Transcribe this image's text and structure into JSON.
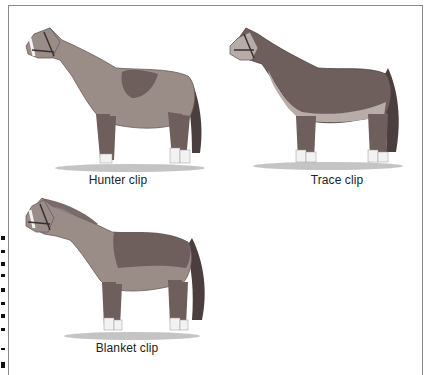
{
  "figure": {
    "panels": [
      {
        "id": "hunter",
        "caption": "Hunter clip",
        "description": "Horse with clipped body, saddle patch and legs left unclipped"
      },
      {
        "id": "trace",
        "caption": "Trace clip",
        "description": "Horse with lower neck, belly and upper legs clipped"
      },
      {
        "id": "blanket",
        "caption": "Blanket clip",
        "description": "Horse with neck and belly clipped, blanket area over back unclipped"
      }
    ],
    "colors": {
      "clipped_coat": "#9a8c87",
      "full_coat": "#6e5f5c",
      "light_band": "#b8aca8",
      "mane_tail": "#4a3f3e",
      "hoof_white": "#f2f2f2",
      "ground_shadow": "#bdbdbd",
      "frame_border": "#8a8a8a"
    }
  }
}
